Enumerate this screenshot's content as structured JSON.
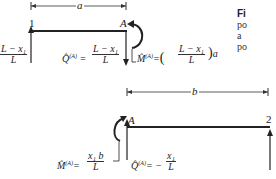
{
  "figure": {
    "caption_fragment": {
      "label": "Fi",
      "lines": [
        "po",
        "a",
        "po"
      ]
    },
    "upper_beam": {
      "dimension_label": "a",
      "node_left": "1",
      "node_right": "A",
      "left_reaction": {
        "num": "L − x₁",
        "den": "L"
      },
      "shear": {
        "symbol": "Q̂",
        "superscript": "(A)",
        "eq": "=",
        "num": "L − x₁",
        "den": "L"
      },
      "moment": {
        "symbol": "M̂",
        "superscript": "(A)",
        "eq": "=",
        "open": "(",
        "num": "L − x₁",
        "den": "L",
        "close": ")",
        "factor": "a"
      }
    },
    "lower_beam": {
      "dimension_label": "b",
      "node_left": "A",
      "node_right": "2",
      "moment": {
        "symbol": "M̂",
        "superscript": "(A)",
        "eq": "=",
        "num": "x₁ b",
        "den": "L"
      },
      "shear": {
        "symbol": "Q̂",
        "superscript": "(A)",
        "eq": "= −",
        "num": "x₁",
        "den": "L"
      }
    }
  }
}
